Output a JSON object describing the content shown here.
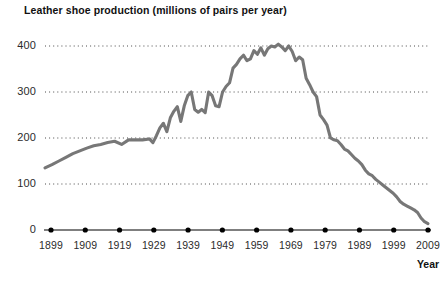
{
  "chart_data": {
    "type": "line",
    "title": "Leather shoe production (millions of pairs per year)",
    "xlabel": "Year",
    "ylabel": "",
    "xlim": [
      1899,
      2009
    ],
    "ylim": [
      0,
      430
    ],
    "grid": true,
    "legend": false,
    "xticks": [
      "1899",
      "1909",
      "1919",
      "1929",
      "1939",
      "1949",
      "1959",
      "1969",
      "1979",
      "1989",
      "1999",
      "2009"
    ],
    "yticks": [
      "0",
      "100",
      "200",
      "300",
      "400"
    ],
    "line_color": "#777777",
    "series": [
      {
        "name": "Leather shoe production",
        "x": [
          1899,
          1901,
          1903,
          1905,
          1907,
          1909,
          1911,
          1913,
          1915,
          1917,
          1919,
          1921,
          1923,
          1925,
          1927,
          1929,
          1930,
          1931,
          1932,
          1933,
          1934,
          1935,
          1936,
          1937,
          1938,
          1939,
          1940,
          1941,
          1942,
          1943,
          1944,
          1945,
          1946,
          1947,
          1948,
          1949,
          1950,
          1951,
          1952,
          1953,
          1954,
          1955,
          1956,
          1957,
          1958,
          1959,
          1960,
          1961,
          1962,
          1963,
          1964,
          1965,
          1966,
          1967,
          1968,
          1969,
          1970,
          1971,
          1972,
          1973,
          1974,
          1975,
          1976,
          1977,
          1978,
          1979,
          1980,
          1981,
          1982,
          1983,
          1984,
          1985,
          1986,
          1987,
          1988,
          1989,
          1990,
          1991,
          1992,
          1993,
          1994,
          1995,
          1996,
          1997,
          1998,
          1999,
          2000,
          2001,
          2002,
          2003,
          2004,
          2005,
          2006,
          2007,
          2008,
          2009
        ],
        "y": [
          135,
          142,
          150,
          158,
          166,
          172,
          178,
          183,
          186,
          190,
          193,
          186,
          196,
          196,
          196,
          198,
          190,
          205,
          222,
          232,
          214,
          244,
          258,
          268,
          236,
          270,
          292,
          300,
          262,
          256,
          262,
          255,
          300,
          292,
          270,
          268,
          300,
          312,
          320,
          352,
          360,
          372,
          380,
          368,
          372,
          390,
          382,
          396,
          380,
          394,
          400,
          398,
          404,
          398,
          390,
          400,
          388,
          368,
          376,
          370,
          330,
          316,
          300,
          290,
          250,
          240,
          228,
          200,
          196,
          194,
          186,
          176,
          172,
          164,
          156,
          150,
          142,
          130,
          122,
          118,
          110,
          104,
          98,
          92,
          86,
          80,
          72,
          62,
          56,
          52,
          48,
          44,
          38,
          26,
          18,
          14
        ]
      }
    ]
  }
}
